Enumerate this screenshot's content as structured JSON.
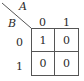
{
  "kmap": {
    "col_variable": "A",
    "row_variable": "B",
    "col_headers": [
      "0",
      "1"
    ],
    "row_headers": [
      "0",
      "1"
    ],
    "cells": [
      [
        "1",
        "0"
      ],
      [
        "0",
        "0"
      ]
    ]
  }
}
